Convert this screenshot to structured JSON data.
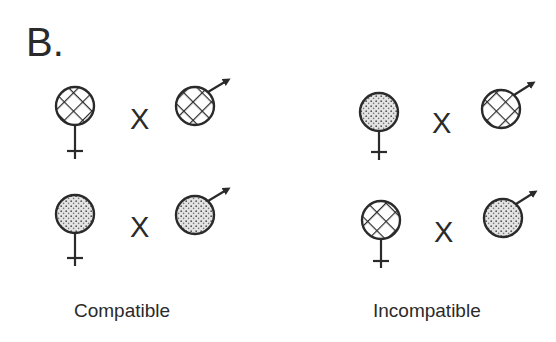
{
  "panel_label": "B.",
  "cross_symbol": "X",
  "groups": [
    {
      "caption": "Compatible",
      "crosses": [
        {
          "female": "hatched",
          "male": "hatched"
        },
        {
          "female": "stippled",
          "male": "stippled"
        }
      ]
    },
    {
      "caption": "Incompatible",
      "crosses": [
        {
          "female": "stippled",
          "male": "hatched"
        },
        {
          "female": "hatched",
          "male": "stippled"
        }
      ]
    }
  ],
  "legend_patterns": {
    "hatched": "cross-hatched",
    "stippled": "stippled"
  },
  "colors": {
    "stroke": "#2a2a2a",
    "background": "#ffffff"
  }
}
